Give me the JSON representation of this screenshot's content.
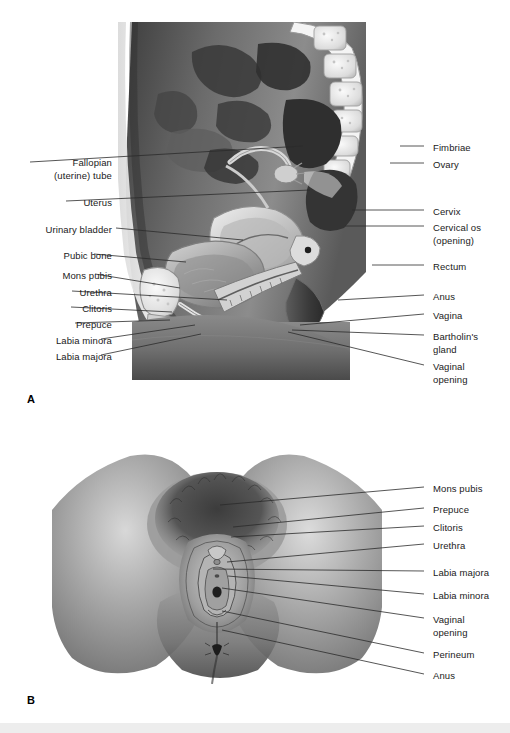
{
  "figure": {
    "panels": [
      {
        "letter": "A",
        "name": "sagittal-section",
        "letter_x": 27,
        "letter_y": 393,
        "labels_left": [
          {
            "text": "Fallopian",
            "x": 112,
            "y": 157,
            "line": null
          },
          {
            "text": "(uterine) tube",
            "x": 112,
            "y": 170,
            "line": {
              "x1": 30,
              "y1": 162,
              "x2": 303,
              "y2": 146
            }
          },
          {
            "text": "Uterus",
            "x": 112,
            "y": 197,
            "line": {
              "x1": 66,
              "y1": 201,
              "x2": 310,
              "y2": 190
            }
          },
          {
            "text": "Urinary bladder",
            "x": 112,
            "y": 224,
            "line": {
              "x1": 116,
              "y1": 228,
              "x2": 243,
              "y2": 240
            }
          },
          {
            "text": "Pubic bone",
            "x": 112,
            "y": 250,
            "line": {
              "x1": 94,
              "y1": 254,
              "x2": 186,
              "y2": 262
            }
          },
          {
            "text": "Mons pubis",
            "x": 112,
            "y": 270,
            "line": {
              "x1": 95,
              "y1": 274,
              "x2": 180,
              "y2": 288
            }
          },
          {
            "text": "Urethra",
            "x": 112,
            "y": 287,
            "line": {
              "x1": 72,
              "y1": 291,
              "x2": 227,
              "y2": 300
            }
          },
          {
            "text": "Clitoris",
            "x": 112,
            "y": 303,
            "line": {
              "x1": 71,
              "y1": 307,
              "x2": 172,
              "y2": 312
            }
          },
          {
            "text": "Prepuce",
            "x": 112,
            "y": 319,
            "line": {
              "x1": 75,
              "y1": 323,
              "x2": 170,
              "y2": 320
            }
          },
          {
            "text": "Labia minora",
            "x": 112,
            "y": 335,
            "line": {
              "x1": 101,
              "y1": 339,
              "x2": 195,
              "y2": 325
            }
          },
          {
            "text": "Labia majora",
            "x": 112,
            "y": 351,
            "line": {
              "x1": 101,
              "y1": 355,
              "x2": 201,
              "y2": 334
            }
          }
        ],
        "labels_right": [
          {
            "text": "Fimbriae",
            "x": 433,
            "y": 142,
            "line": {
              "x1": 400,
              "y1": 146,
              "x2": 424,
              "y2": 146
            }
          },
          {
            "text": "Ovary",
            "x": 433,
            "y": 159,
            "line": {
              "x1": 390,
              "y1": 163,
              "x2": 424,
              "y2": 163
            }
          },
          {
            "text": "Cervix",
            "x": 433,
            "y": 206,
            "line": {
              "x1": 352,
              "y1": 210,
              "x2": 424,
              "y2": 210
            }
          },
          {
            "text": "Cervical os",
            "x": 433,
            "y": 222,
            "line": {
              "x1": 345,
              "y1": 226,
              "x2": 424,
              "y2": 226
            }
          },
          {
            "text": "(opening)",
            "x": 433,
            "y": 235,
            "line": null
          },
          {
            "text": "Rectum",
            "x": 433,
            "y": 261,
            "line": {
              "x1": 372,
              "y1": 265,
              "x2": 424,
              "y2": 265
            }
          },
          {
            "text": "Anus",
            "x": 433,
            "y": 291,
            "line": {
              "x1": 338,
              "y1": 300,
              "x2": 424,
              "y2": 295
            }
          },
          {
            "text": "Vagina",
            "x": 433,
            "y": 310,
            "line": {
              "x1": 300,
              "y1": 325,
              "x2": 424,
              "y2": 314
            }
          },
          {
            "text": "Bartholin's",
            "x": 433,
            "y": 331,
            "line": {
              "x1": 292,
              "y1": 330,
              "x2": 424,
              "y2": 335
            }
          },
          {
            "text": "gland",
            "x": 433,
            "y": 344,
            "line": null
          },
          {
            "text": "Vaginal",
            "x": 433,
            "y": 361,
            "line": {
              "x1": 288,
              "y1": 332,
              "x2": 424,
              "y2": 365
            }
          },
          {
            "text": "opening",
            "x": 433,
            "y": 374,
            "line": null
          }
        ]
      },
      {
        "letter": "B",
        "name": "external-genitalia-view",
        "letter_x": 27,
        "letter_y": 694,
        "labels_left": [],
        "labels_right": [
          {
            "text": "Mons pubis",
            "x": 433,
            "y": 483,
            "line": {
              "x1": 220,
              "y1": 505,
              "x2": 424,
              "y2": 487
            }
          },
          {
            "text": "Prepuce",
            "x": 433,
            "y": 504,
            "line": {
              "x1": 233,
              "y1": 527,
              "x2": 424,
              "y2": 508
            }
          },
          {
            "text": "Clitoris",
            "x": 433,
            "y": 522,
            "line": {
              "x1": 231,
              "y1": 537,
              "x2": 424,
              "y2": 526
            }
          },
          {
            "text": "Urethra",
            "x": 433,
            "y": 540,
            "line": {
              "x1": 227,
              "y1": 562,
              "x2": 424,
              "y2": 544
            }
          },
          {
            "text": "Labia majora",
            "x": 433,
            "y": 567,
            "line": {
              "x1": 213,
              "y1": 569,
              "x2": 424,
              "y2": 571
            }
          },
          {
            "text": "Labia minora",
            "x": 433,
            "y": 590,
            "line": {
              "x1": 228,
              "y1": 576,
              "x2": 424,
              "y2": 594
            }
          },
          {
            "text": "Vaginal",
            "x": 433,
            "y": 614,
            "line": {
              "x1": 222,
              "y1": 588,
              "x2": 424,
              "y2": 618
            }
          },
          {
            "text": "opening",
            "x": 433,
            "y": 627,
            "line": null
          },
          {
            "text": "Perineum",
            "x": 433,
            "y": 649,
            "line": {
              "x1": 222,
              "y1": 611,
              "x2": 424,
              "y2": 653
            }
          },
          {
            "text": "Anus",
            "x": 433,
            "y": 670,
            "line": {
              "x1": 222,
              "y1": 630,
              "x2": 424,
              "y2": 674
            }
          }
        ]
      }
    ]
  },
  "colors": {
    "text": "#1a1a1a",
    "leader": "#2b2b2b",
    "page_background": "#ffffff",
    "bottom_band": "#ededed"
  }
}
